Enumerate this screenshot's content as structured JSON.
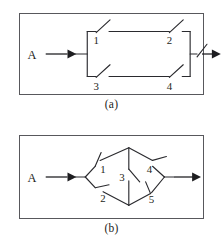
{
  "figure": {
    "top_cropped_text": "",
    "panels": [
      {
        "id": "a",
        "caption": "(a)",
        "type": "series-parallel-switching-network",
        "terminals": {
          "input": "A",
          "output": "B"
        },
        "switch_labels": [
          "1",
          "2",
          "3",
          "4"
        ],
        "description": "Two parallel branches each containing two series switches between terminals A and B"
      },
      {
        "id": "b",
        "caption": "(b)",
        "type": "bridge-switching-network",
        "terminals": {
          "input": "A",
          "output": "B"
        },
        "switch_labels": [
          "1",
          "2",
          "3",
          "4",
          "5"
        ],
        "description": "Bridge network with switch 3 as the bridging element between the upper and lower branches"
      }
    ]
  },
  "colors": {
    "frame_border": "#58585c",
    "wire": "#2a2a2e",
    "text": "#1d1d20",
    "background": "#ffffff"
  }
}
